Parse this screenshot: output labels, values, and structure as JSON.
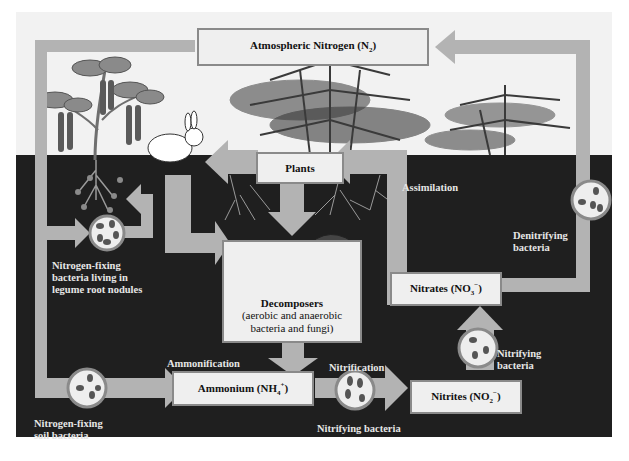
{
  "diagram": {
    "type": "nitrogen-cycle",
    "colors": {
      "sky": "#f2f2f2",
      "soil": "#1f1f1f",
      "arrow": "#b3b3b3",
      "box_fill": "#efefef",
      "box_border": "#8a8a8a",
      "label_light": "#e6e6e6"
    },
    "boxes": {
      "atmospheric": {
        "text": "Atmospheric Nitrogen (N",
        "sub": "2",
        "tail": ")"
      },
      "plants": {
        "text": "Plants"
      },
      "decomposers": {
        "title": "Decomposers",
        "line1": "(aerobic and anaerobic",
        "line2": "bacteria and fungi)"
      },
      "ammonium": {
        "text": "Ammonium (NH",
        "sub": "4",
        "sup": "+",
        "tail": ")"
      },
      "nitrites": {
        "text": "Nitrites (NO",
        "sub": "2",
        "sup": "−",
        "tail": ")"
      },
      "nitrates": {
        "text": "Nitrates (NO",
        "sub": "3",
        "sup": "−",
        "tail": ")"
      }
    },
    "labels": {
      "assimilation": "Assimilation",
      "denitrifying_1": "Denitrifying",
      "denitrifying_2": "bacteria",
      "legume_1": "Nitrogen-fixing",
      "legume_2": "bacteria living in",
      "legume_3": "legume root nodules",
      "ammonification": "Ammonification",
      "nitrification": "Nitrification",
      "nitrifying_bottom": "Nitrifying bacteria",
      "nitrifying_right_1": "Nitrifying",
      "nitrifying_right_2": "bacteria",
      "soil_fixing_1": "Nitrogen-fixing",
      "soil_fixing_2": "soil bacteria"
    },
    "illustrations": [
      "legume-plant",
      "rabbit",
      "trees",
      "roots",
      "mushrooms",
      "bacteria-circles"
    ]
  }
}
